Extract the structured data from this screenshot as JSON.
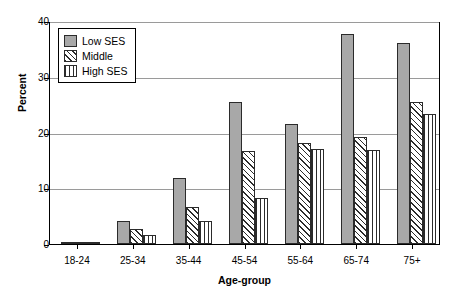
{
  "chart_data": {
    "type": "bar",
    "title": "",
    "xlabel": "Age-group",
    "ylabel": "Percent",
    "ylim": [
      0,
      40
    ],
    "yticks": [
      0,
      10,
      20,
      30,
      40
    ],
    "grid": true,
    "legend_position": "top-left",
    "categories": [
      "18-24",
      "25-34",
      "35-44",
      "45-54",
      "55-64",
      "65-74",
      "75+"
    ],
    "series": [
      {
        "name": "Low SES",
        "pattern": "solid-gray",
        "values": [
          0.2,
          4.2,
          11.8,
          25.5,
          21.5,
          37.6,
          36.0
        ]
      },
      {
        "name": "Middle",
        "pattern": "diagonal-hatch",
        "values": [
          0.2,
          2.7,
          6.6,
          16.6,
          18.2,
          19.2,
          25.5
        ]
      },
      {
        "name": "High SES",
        "pattern": "vertical-hatch",
        "values": [
          0.2,
          1.6,
          4.1,
          8.2,
          17.1,
          16.9,
          23.4
        ]
      }
    ]
  },
  "axes": {
    "y_title": "Percent",
    "x_title": "Age-group",
    "y_tick_labels": [
      "0",
      "10",
      "20",
      "30",
      "40"
    ],
    "x_tick_labels": [
      "18-24",
      "25-34",
      "35-44",
      "45-54",
      "55-64",
      "65-74",
      "75+"
    ]
  },
  "legend": {
    "items": [
      {
        "label": "Low SES"
      },
      {
        "label": "Middle"
      },
      {
        "label": "High SES"
      }
    ]
  },
  "colors": {
    "bar_fill_low": "#a8a8a8",
    "bar_outline": "#2b2b2b",
    "gridline": "#9a9a9a",
    "axis": "#000000",
    "background": "#ffffff"
  }
}
